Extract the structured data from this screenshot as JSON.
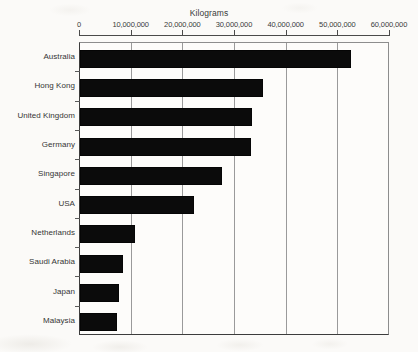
{
  "chart_data": {
    "type": "bar",
    "orientation": "horizontal",
    "title": "Kilograms",
    "xlabel": "",
    "ylabel": "",
    "categories": [
      "Australia",
      "Hong Kong",
      "United Kingdom",
      "Germany",
      "Singapore",
      "USA",
      "Netherlands",
      "Saudi Arabia",
      "Japan",
      "Malaysia"
    ],
    "values": [
      52500000,
      35400000,
      33200000,
      33000000,
      27500000,
      22100000,
      10600000,
      8300000,
      7500000,
      7200000
    ],
    "xlim": [
      0,
      60000000
    ],
    "xticks": [
      0,
      10000000,
      20000000,
      30000000,
      40000000,
      50000000,
      60000000
    ],
    "xticklabels": [
      "0",
      "10,000,000",
      "20,000,000",
      "30,000,000",
      "40,000,000",
      "50,000,000",
      "60,000,000"
    ],
    "grid": "vertical",
    "legend": null,
    "bar_color": "#0b0b0b"
  }
}
